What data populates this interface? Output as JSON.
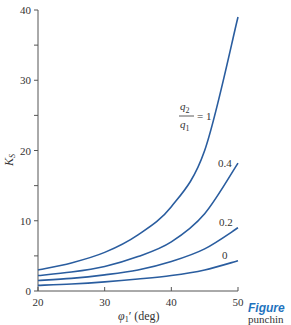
{
  "chart_data": {
    "type": "line",
    "title": "",
    "xlabel": "φ1' (deg)",
    "ylabel": "Ks",
    "xlim": [
      20,
      50
    ],
    "ylim": [
      0,
      40
    ],
    "x_ticks": [
      "20",
      "30",
      "40",
      "50"
    ],
    "y_ticks": [
      "0",
      "10",
      "20",
      "30",
      "40"
    ],
    "grid": false,
    "legend": "inline labels at curve ends",
    "x": [
      20,
      25,
      30,
      35,
      40,
      45,
      50
    ],
    "series": [
      {
        "name": "q2/q1 = 1",
        "values": [
          3.0,
          4.0,
          5.5,
          8.0,
          12.0,
          20.0,
          39.0
        ]
      },
      {
        "name": "0.4",
        "values": [
          2.2,
          2.7,
          3.5,
          4.9,
          7.0,
          11.0,
          18.2
        ]
      },
      {
        "name": "0.2",
        "values": [
          1.5,
          1.8,
          2.3,
          3.0,
          4.2,
          6.0,
          9.0
        ]
      },
      {
        "name": "0",
        "values": [
          0.8,
          1.0,
          1.3,
          1.7,
          2.2,
          3.0,
          4.3
        ]
      }
    ],
    "line_color": "#2a5d9f"
  },
  "labels": {
    "curve_q_num": "q",
    "curve_q_num_sub": "2",
    "curve_q_den": "q",
    "curve_q_den_sub": "1",
    "curve_eq": "= 1",
    "curve_04": "0.4",
    "curve_02": "0.2",
    "curve_0": "0",
    "y_axis": "K",
    "y_axis_sub": "S",
    "x_axis": "φ",
    "x_axis_sub": "1",
    "x_axis_rest": "′ (deg)"
  },
  "caption": {
    "title": "Figure",
    "text": "punchin"
  }
}
